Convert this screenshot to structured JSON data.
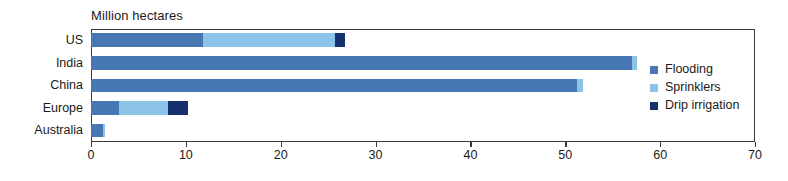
{
  "chart_data": {
    "type": "bar",
    "orientation": "horizontal",
    "stacked": true,
    "title": "Million hectares",
    "xlabel": "",
    "ylabel": "",
    "xlim": [
      0,
      70
    ],
    "xticks": [
      0,
      10,
      20,
      30,
      40,
      50,
      60,
      70
    ],
    "xtick_labels": [
      "0",
      "10",
      "20",
      "30",
      "40",
      "50",
      "60",
      "70"
    ],
    "grid": false,
    "legend_position": "inside-right",
    "categories": [
      "US",
      "India",
      "China",
      "Europe",
      "Australia"
    ],
    "series": [
      {
        "name": "Flooding",
        "color": "#4878b4",
        "values": [
          11.8,
          57.0,
          51.2,
          2.9,
          1.3
        ]
      },
      {
        "name": "Sprinklers",
        "color": "#8cc3e8",
        "values": [
          13.9,
          0.6,
          0.7,
          5.2,
          0.2
        ]
      },
      {
        "name": "Drip irrigation",
        "color": "#17306e",
        "values": [
          1.1,
          0.0,
          0.0,
          2.1,
          0.0
        ]
      }
    ],
    "totals": [
      26.8,
      57.6,
      51.9,
      10.2,
      1.5
    ]
  },
  "legend": {
    "items": [
      {
        "label": "Flooding",
        "color": "#4878b4"
      },
      {
        "label": "Sprinklers",
        "color": "#8cc3e8"
      },
      {
        "label": "Drip irrigation",
        "color": "#17306e"
      }
    ]
  }
}
